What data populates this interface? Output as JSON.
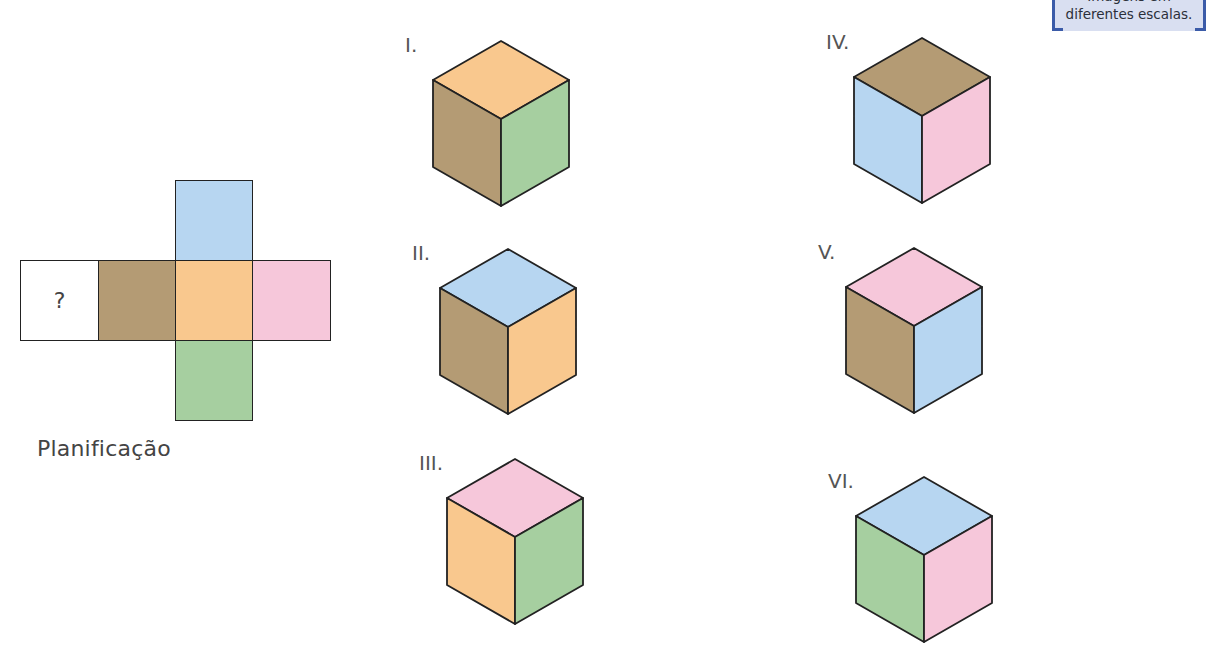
{
  "note": {
    "line1": "Imagens em",
    "line2": "diferentes escalas."
  },
  "colors": {
    "brown": "#b49b74",
    "orange": "#f9c88e",
    "pink": "#f6c7da",
    "blue": "#b7d6f1",
    "green": "#a6cfa0",
    "white": "#ffffff",
    "stroke": "#222222"
  },
  "net": {
    "caption": "Planificação",
    "unknown_label": "?",
    "cells": [
      {
        "id": "unknown",
        "color": "white",
        "row": 1,
        "col": 0
      },
      {
        "id": "left",
        "color": "brown",
        "row": 1,
        "col": 1
      },
      {
        "id": "center",
        "color": "orange",
        "row": 1,
        "col": 2
      },
      {
        "id": "right",
        "color": "pink",
        "row": 1,
        "col": 3
      },
      {
        "id": "top",
        "color": "blue",
        "row": 0,
        "col": 2
      },
      {
        "id": "bottom",
        "color": "green",
        "row": 2,
        "col": 2
      }
    ]
  },
  "cubes": [
    {
      "label": "I.",
      "top": "orange",
      "left": "brown",
      "right": "green",
      "cx": 501,
      "ty": 41
    },
    {
      "label": "II.",
      "top": "blue",
      "left": "brown",
      "right": "orange",
      "cx": 508,
      "ty": 249
    },
    {
      "label": "III.",
      "top": "pink",
      "left": "orange",
      "right": "green",
      "cx": 515,
      "ty": 459
    },
    {
      "label": "IV.",
      "top": "brown",
      "left": "blue",
      "right": "pink",
      "cx": 922,
      "ty": 38
    },
    {
      "label": "V.",
      "top": "pink",
      "left": "brown",
      "right": "blue",
      "cx": 914,
      "ty": 248
    },
    {
      "label": "VI.",
      "top": "blue",
      "left": "green",
      "right": "pink",
      "cx": 924,
      "ty": 477
    }
  ]
}
